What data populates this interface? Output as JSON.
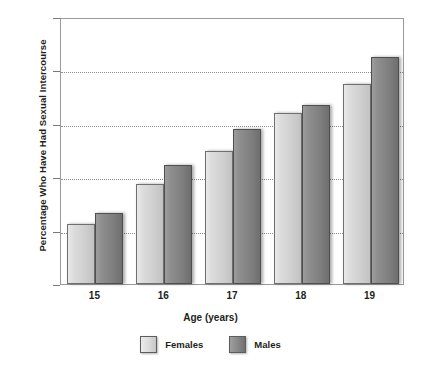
{
  "chart_data": {
    "type": "bar",
    "title": "",
    "xlabel": "Age (years)",
    "ylabel": "Percentage Who Have Had Sexual Intercourse",
    "categories": [
      "15",
      "16",
      "17",
      "18",
      "19"
    ],
    "series": [
      {
        "name": "Females",
        "color": "#dcdcdc",
        "values": [
          22.5,
          37.5,
          50,
          64,
          75
        ]
      },
      {
        "name": "Males",
        "color": "#808080",
        "values": [
          26.5,
          44.5,
          58,
          67,
          85
        ]
      }
    ],
    "ylim": [
      0,
      100
    ],
    "yticks": [
      "0",
      "20",
      "40",
      "60",
      "80",
      "100"
    ],
    "grid": "horizontal-dotted",
    "legend_position": "bottom"
  }
}
